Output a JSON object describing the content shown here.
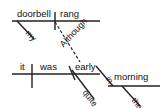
{
  "diagram": {
    "type": "sentence-diagram",
    "sentence": "Although my doorbell rang, it was quite early in the morning",
    "colors": {
      "ink": "#111111",
      "line": "#222222",
      "background": "#ffffff"
    },
    "clauses": {
      "main": {
        "subject": "doorbell",
        "verb": "rang",
        "subject_modifier": "my"
      },
      "subordinate": {
        "conjunction": "Although",
        "subject": "it",
        "verb": "was",
        "complement": "early",
        "complement_modifier": "quite",
        "preposition": "in",
        "object_of_preposition": "morning",
        "object_modifier": "the"
      }
    },
    "words": [
      {
        "id": "doorbell",
        "text": "doorbell",
        "x": 17,
        "y": 18,
        "rotate": 0,
        "size": 9.5
      },
      {
        "id": "rang",
        "text": "rang",
        "x": 60,
        "y": 18,
        "rotate": 0,
        "size": 9.5
      },
      {
        "id": "my",
        "text": "my",
        "x": 24,
        "y": 34,
        "rotate": 47,
        "size": 8.5
      },
      {
        "id": "although",
        "text": "Although",
        "x": 65,
        "y": 49,
        "rotate": -47,
        "size": 9.0
      },
      {
        "id": "it",
        "text": "it",
        "x": 20,
        "y": 71,
        "rotate": 0,
        "size": 9.5
      },
      {
        "id": "was",
        "text": "was",
        "x": 40,
        "y": 71,
        "rotate": 0,
        "size": 9.5
      },
      {
        "id": "early",
        "text": "early",
        "x": 75,
        "y": 71,
        "rotate": 0,
        "size": 9.5
      },
      {
        "id": "quite",
        "text": "quite",
        "x": 81,
        "y": 93,
        "rotate": 52,
        "size": 8.5
      },
      {
        "id": "in",
        "text": "in",
        "x": 104,
        "y": 79,
        "rotate": 55,
        "size": 8.5
      },
      {
        "id": "morning",
        "text": "morning",
        "x": 114,
        "y": 81,
        "rotate": 0,
        "size": 9.5
      },
      {
        "id": "the",
        "text": "the",
        "x": 130,
        "y": 101,
        "rotate": 52,
        "size": 8.5
      }
    ],
    "lines": [
      {
        "id": "main-baseline",
        "x1": 12,
        "y1": 21,
        "x2": 100,
        "y2": 21,
        "width": 1.4,
        "dash": "none"
      },
      {
        "id": "main-subject-verb-divider",
        "x1": 55,
        "y1": 12,
        "x2": 55,
        "y2": 30,
        "width": 1.4,
        "dash": "none"
      },
      {
        "id": "my-modifier-slant",
        "x1": 17,
        "y1": 21,
        "x2": 34,
        "y2": 39,
        "width": 1.4,
        "dash": "none"
      },
      {
        "id": "although-connector",
        "x1": 55,
        "y1": 22,
        "x2": 80,
        "y2": 62,
        "width": 1.2,
        "dash": "3,2"
      },
      {
        "id": "sub-baseline",
        "x1": 12,
        "y1": 74,
        "x2": 100,
        "y2": 74,
        "width": 1.4,
        "dash": "none"
      },
      {
        "id": "sub-subject-verb-divider",
        "x1": 32,
        "y1": 64,
        "x2": 32,
        "y2": 88,
        "width": 1.4,
        "dash": "none"
      },
      {
        "id": "predicate-slant-divider",
        "x1": 69,
        "y1": 66,
        "x2": 75,
        "y2": 80,
        "width": 1.4,
        "dash": "none"
      },
      {
        "id": "quite-modifier-slant",
        "x1": 72,
        "y1": 70,
        "x2": 94,
        "y2": 99,
        "width": 1.4,
        "dash": "none"
      },
      {
        "id": "in-prep-slant",
        "x1": 96,
        "y1": 66,
        "x2": 113,
        "y2": 86,
        "width": 1.4,
        "dash": "none"
      },
      {
        "id": "prep-object-baseline",
        "x1": 108,
        "y1": 86,
        "x2": 160,
        "y2": 86,
        "width": 1.4,
        "dash": "none"
      },
      {
        "id": "the-modifier-slant",
        "x1": 122,
        "y1": 86,
        "x2": 140,
        "y2": 106,
        "width": 1.4,
        "dash": "none"
      }
    ]
  }
}
